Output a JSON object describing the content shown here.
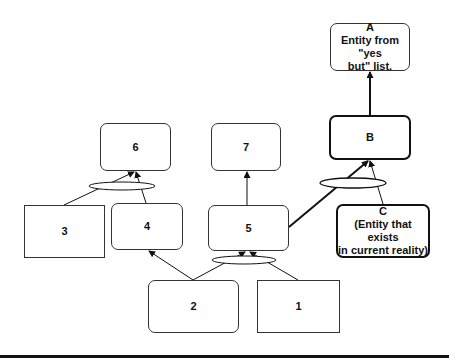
{
  "diagram": {
    "nodes": [
      {
        "id": "A",
        "lines": [
          "A",
          "Entity from \"yes",
          "but\" list."
        ],
        "shape": "rounded",
        "border": "thin",
        "x": 330,
        "y": 23,
        "w": 80,
        "h": 48
      },
      {
        "id": "B",
        "lines": [
          "B"
        ],
        "shape": "rounded",
        "border": "thick",
        "x": 329,
        "y": 115,
        "w": 82,
        "h": 45
      },
      {
        "id": "C",
        "lines": [
          "C",
          "(Entity that exists",
          "in current reality)"
        ],
        "shape": "rounded",
        "border": "thick",
        "x": 336,
        "y": 204,
        "w": 94,
        "h": 54
      },
      {
        "id": "6",
        "lines": [
          "6"
        ],
        "shape": "rounded",
        "border": "thin",
        "x": 100,
        "y": 123,
        "w": 71,
        "h": 48
      },
      {
        "id": "7",
        "lines": [
          "7"
        ],
        "shape": "rounded",
        "border": "thin",
        "x": 211,
        "y": 123,
        "w": 70,
        "h": 48
      },
      {
        "id": "3",
        "lines": [
          "3"
        ],
        "shape": "square",
        "border": "thin",
        "x": 24,
        "y": 205,
        "w": 81,
        "h": 53
      },
      {
        "id": "4",
        "lines": [
          "4"
        ],
        "shape": "rounded",
        "border": "thin",
        "x": 111,
        "y": 203,
        "w": 72,
        "h": 47
      },
      {
        "id": "5",
        "lines": [
          "5"
        ],
        "shape": "rounded",
        "border": "thin",
        "x": 208,
        "y": 205,
        "w": 81,
        "h": 46
      },
      {
        "id": "2",
        "lines": [
          "2"
        ],
        "shape": "rounded",
        "border": "thin",
        "x": 148,
        "y": 280,
        "w": 91,
        "h": 53
      },
      {
        "id": "1",
        "lines": [
          "1"
        ],
        "shape": "square",
        "border": "thin",
        "x": 257,
        "y": 280,
        "w": 83,
        "h": 53
      }
    ],
    "connectors": [
      {
        "from": "A",
        "to": "B",
        "type": "arrow",
        "weight": "thick",
        "note": "B to A"
      },
      {
        "from": "5",
        "to": "B",
        "type": "arrow",
        "weight": "thick",
        "and_group": "B"
      },
      {
        "from": "C",
        "to": "B",
        "type": "arrow",
        "weight": "thin",
        "and_group": "B"
      },
      {
        "from": "5",
        "to": "7",
        "type": "arrow",
        "weight": "thin"
      },
      {
        "from": "3",
        "to": "6",
        "type": "arrow",
        "weight": "thin",
        "and_group": "6"
      },
      {
        "from": "4",
        "to": "6",
        "type": "arrow",
        "weight": "thin",
        "and_group": "6"
      },
      {
        "from": "2",
        "to": "4",
        "type": "arrow",
        "weight": "thin"
      },
      {
        "from": "2",
        "to": "5",
        "type": "arrow",
        "weight": "thin",
        "and_group": "5"
      },
      {
        "from": "1",
        "to": "5",
        "type": "arrow",
        "weight": "thin",
        "and_group": "5"
      }
    ],
    "and_ellipses": [
      {
        "id": "6",
        "cx": 122,
        "cy": 186,
        "rx": 33,
        "ry": 4
      },
      {
        "id": "5",
        "cx": 244,
        "cy": 260,
        "rx": 32,
        "ry": 4
      },
      {
        "id": "B",
        "cx": 353,
        "cy": 183,
        "rx": 33,
        "ry": 5
      }
    ],
    "colors": {
      "line": "#111111",
      "background": "#ffffff"
    }
  }
}
